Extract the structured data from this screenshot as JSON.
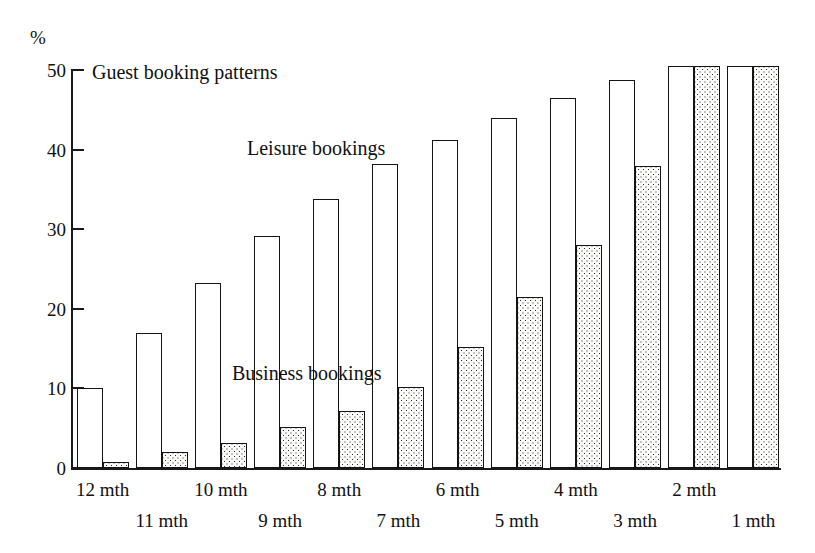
{
  "chart_data": {
    "type": "bar",
    "title": "Guest booking patterns",
    "xlabel": "",
    "ylabel": "%",
    "ylim": [
      0,
      50
    ],
    "yticks": [
      0,
      10,
      20,
      30,
      40,
      50
    ],
    "grid": false,
    "legend_position": "in-plot annotations",
    "categories": [
      "12 mth",
      "11 mth",
      "10 mth",
      "9 mth",
      "8 mth",
      "7 mth",
      "6 mth",
      "5 mth",
      "4 mth",
      "3 mth",
      "2 mth",
      "1 mth"
    ],
    "series": [
      {
        "name": "Leisure bookings",
        "fill": "white-outline",
        "values": [
          10.0,
          17.0,
          23.2,
          29.2,
          33.8,
          38.2,
          41.2,
          44.0,
          46.5,
          48.8,
          50.5,
          50.5
        ]
      },
      {
        "name": "Business bookings",
        "fill": "stipple",
        "values": [
          0.8,
          2.0,
          3.2,
          5.2,
          7.2,
          10.2,
          15.2,
          21.5,
          28.0,
          38.0,
          50.5,
          50.5
        ]
      }
    ],
    "annotations": [
      {
        "text": "Guest booking patterns",
        "name": "chart-title"
      },
      {
        "text": "Leisure bookings",
        "name": "leisure-series-label"
      },
      {
        "text": "Business bookings",
        "name": "business-series-label"
      }
    ]
  },
  "axis": {
    "y_unit": "%",
    "y_tick_labels": [
      "0",
      "10",
      "20",
      "30",
      "40",
      "50"
    ]
  }
}
